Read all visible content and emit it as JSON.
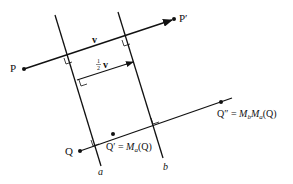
{
  "diagram": {
    "colors": {
      "stroke": "#111111",
      "background": "#ffffff"
    },
    "lines": [
      {
        "name": "a",
        "label": "a"
      },
      {
        "name": "b",
        "label": "b"
      }
    ],
    "vectors": [
      {
        "name": "v",
        "label": "v"
      },
      {
        "name": "half-v",
        "label_num": "1",
        "label_den": "2",
        "label_var": "v"
      }
    ],
    "points": {
      "P": "P",
      "P_prime": "P′",
      "Q": "Q",
      "Q_prime_lhs": "Q′",
      "Q_prime_eq": " = ",
      "Q_prime_M": "M",
      "Q_prime_sub": "a",
      "Q_prime_arg": "(Q)",
      "Q_dprime_lhs": "Q″",
      "Q_dprime_eq": " = ",
      "Q_dprime_M1": "M",
      "Q_dprime_sub1": "b",
      "Q_dprime_M2": "M",
      "Q_dprime_sub2": "a",
      "Q_dprime_arg": "(Q)"
    }
  }
}
